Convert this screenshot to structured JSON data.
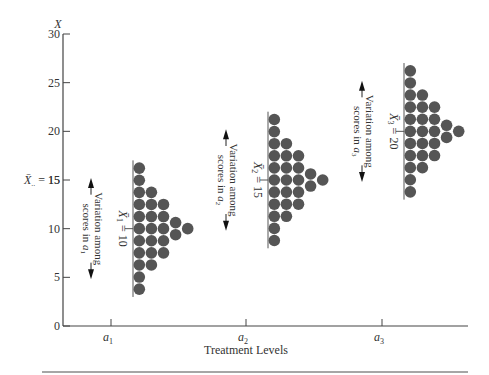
{
  "chart_data": {
    "type": "scatter",
    "subtype": "dot-distribution",
    "title": "",
    "ylabel": "X",
    "xlabel": "Treatment Levels",
    "ylim": [
      0,
      30
    ],
    "yticks": [
      0,
      5,
      10,
      15,
      20,
      25,
      30
    ],
    "ytick_labels": [
      "0",
      "5",
      "10",
      "15",
      "20",
      "25",
      "30"
    ],
    "categories": [
      "a1",
      "a2",
      "a3"
    ],
    "category_labels": [
      {
        "base": "a",
        "sub": "1"
      },
      {
        "base": "a",
        "sub": "2"
      },
      {
        "base": "a",
        "sub": "3"
      }
    ],
    "grand_mean": {
      "value": 15,
      "label_base": "X̄",
      "label_sub": "..",
      "label_eq": "= 15"
    },
    "grid": false,
    "legend": null,
    "dot_column_counts": [
      11,
      7,
      5,
      2,
      1
    ],
    "groups": [
      {
        "level": "a1",
        "mean": 10,
        "mean_label": {
          "base": "X̄",
          "sub": "1",
          "eq": "= 10"
        },
        "variation_label_line1": "Variation among",
        "variation_label_line2_base": "scores in a",
        "variation_label_line2_sub": "1",
        "scores_min": 5,
        "scores_max": 15
      },
      {
        "level": "a2",
        "mean": 15,
        "mean_label": {
          "base": "X̄",
          "sub": "2",
          "eq": "= 15"
        },
        "variation_label_line1": "Variation among",
        "variation_label_line2_base": "scores in a",
        "variation_label_line2_sub": "2",
        "scores_min": 10,
        "scores_max": 20
      },
      {
        "level": "a3",
        "mean": 20,
        "mean_label": {
          "base": "X̄",
          "sub": "3",
          "eq": "= 20"
        },
        "variation_label_line1": "Variation among",
        "variation_label_line2_base": "scores in a",
        "variation_label_line2_sub": "3",
        "scores_min": 15,
        "scores_max": 25
      }
    ]
  },
  "colors": {
    "dot": "#555555",
    "axis": "#444444",
    "text": "#333333",
    "rule": "#888888"
  }
}
